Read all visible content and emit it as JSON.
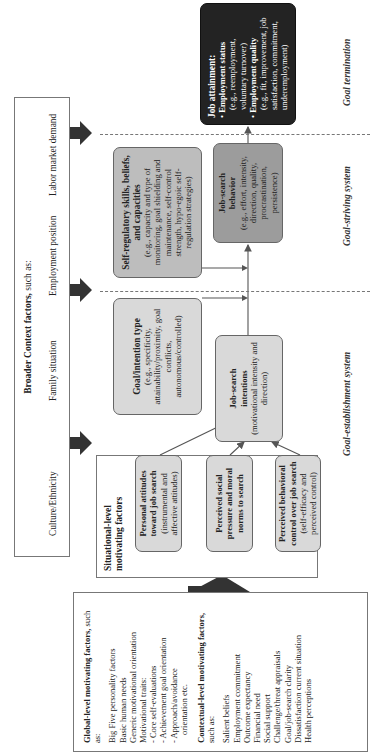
{
  "global_box": {
    "title_bold": "Global-level motivating factors,",
    "title_suffix": " such as:",
    "items": [
      "Big Five personality factors",
      "Basic human needs",
      "Generic motivational orientation",
      "Motivational traits:",
      "- Core self-evaluations",
      "- Achievement goal orientation",
      "- Approach/avoidance",
      "   orientation etc."
    ],
    "contextual_title_bold": "Contextual-level motivating factors,",
    "contextual_title_suffix": " such as:",
    "contextual_items": [
      "Salient beliefs",
      "Employment commitment",
      "Outcome expectancy",
      "Financial need",
      "Social support",
      "Challenge/threat appraisals",
      "Goal/job-search clarity",
      "Dissatisfaction current situation",
      "Health perceptions"
    ]
  },
  "situational_box": {
    "title": "Situational-level motivating factors",
    "inner": [
      {
        "title": "Personal attitudes toward job search",
        "detail": "(instrumental and affective attitudes)"
      },
      {
        "title": "Perceived social pressure and moral norms to search",
        "detail": ""
      },
      {
        "title": "Perceived behavioral control over job search",
        "detail": "(self-efficacy and perceived control)"
      }
    ]
  },
  "broader_context": {
    "title_bold": "Broader Context factors,",
    "title_suffix": " such as:",
    "items": [
      "Culture/Ethnicity",
      "Family situation",
      "Employment position",
      "Labor market demand"
    ]
  },
  "goal_intention": {
    "title": "Goal/intention type",
    "detail": "(e.g., specificity, attainability/proximity, goal conflicts, autonomous/controlled)"
  },
  "job_search_intentions": {
    "title": "Job-search intentions",
    "detail": "(motivational intensity and direction)"
  },
  "self_regulatory": {
    "title": "Self-regulatory skills, beliefs, and capacities",
    "detail": "(e.g., capacity and type of monitoring, goal shielding and maintenance, self-control strength, hypo-egoic self-regulation strategies)"
  },
  "job_search_behavior": {
    "title": "Job-search behavior",
    "detail": "(e.g., effort, intensity, direction, quality, procrastination, persistence)"
  },
  "job_attainment": {
    "title": "Job attainment:",
    "bullets": [
      {
        "label": "Employment status",
        "detail": "(e.g., reemployment, voluntary turnover)"
      },
      {
        "label": "Employment quality",
        "detail": "(e.g., fit, improvement, job satisfaction, commitment, underemployment)"
      }
    ]
  },
  "system_labels": {
    "establishment": "Goal-establishment system",
    "striving": "Goal-striving system",
    "termination": "Goal termination"
  },
  "colors": {
    "light_box": "#d9d9d9",
    "mid_box": "#bdbdbd",
    "dark_box": "#9c9c9c",
    "outcome_box": "#232323",
    "arrow": "#333333"
  }
}
